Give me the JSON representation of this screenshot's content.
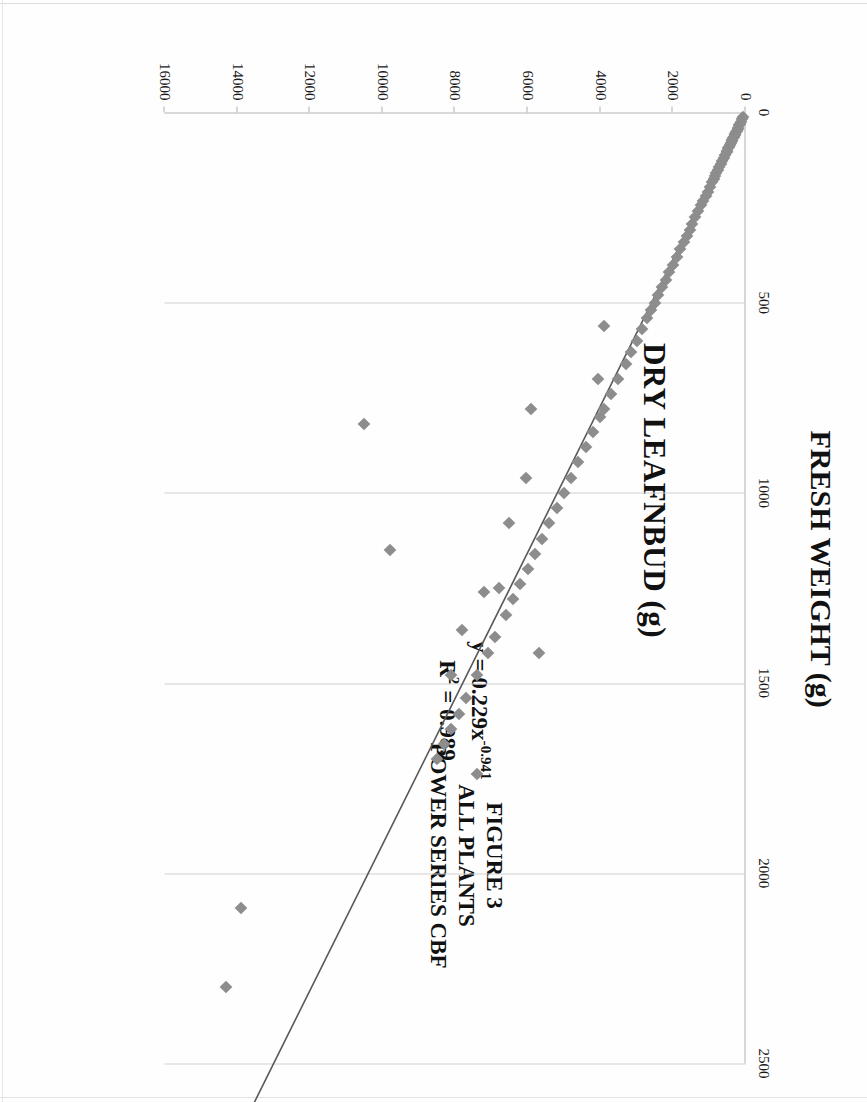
{
  "figure": {
    "caption_lines": [
      "FIGURE 3",
      "ALL PLANTS",
      "POWER SERIES CBF"
    ],
    "caption_line_1": "FIGURE 3",
    "caption_line_2": "ALL PLANTS",
    "caption_line_3": "POWER SERIES CBF"
  },
  "annotation": {
    "equation_prefix": "y = 0.229x",
    "equation_exponent": "-0.941",
    "equation_full": "y = 0.229x-0.941",
    "r_squared_label": "R",
    "r_squared_sup": "2",
    "r_squared_value": " = 0.989",
    "r_squared_full": "R2 = 0.989"
  },
  "chart_data": {
    "type": "scatter",
    "title": "",
    "xlabel": "FRESH WEIGHT (g)",
    "ylabel": "DRY LEAFNBUD (g)",
    "xlim": [
      0,
      16000
    ],
    "ylim": [
      0,
      2500
    ],
    "xticks": [
      0,
      2000,
      4000,
      6000,
      8000,
      10000,
      12000,
      14000,
      16000
    ],
    "xtick_labels": [
      "0",
      "2000",
      "4000",
      "6000",
      "8000",
      "10000",
      "12000",
      "14000",
      "16000"
    ],
    "yticks": [
      0,
      500,
      1000,
      1500,
      2000,
      2500
    ],
    "ytick_labels": [
      "0",
      "500",
      "1000",
      "1500",
      "2000",
      "2500"
    ],
    "grid": true,
    "grid_axis": "y",
    "legend": false,
    "marker": "diamond",
    "marker_color": "#8d8d8d",
    "trendline_color": "#5a5a5a",
    "trendline_type": "power",
    "trendline_equation": "y = 0.229x^-0.941",
    "trendline_r2": 0.989,
    "trendline_coefficient": 0.229,
    "trendline_exponent": 0.941,
    "series": [
      {
        "name": "ALL PLANTS",
        "x": [
          60,
          90,
          120,
          150,
          170,
          200,
          210,
          240,
          260,
          280,
          300,
          320,
          340,
          360,
          380,
          400,
          430,
          450,
          470,
          500,
          520,
          560,
          600,
          640,
          680,
          720,
          760,
          800,
          840,
          880,
          920,
          980,
          1040,
          1100,
          1160,
          1220,
          1300,
          1380,
          1460,
          1540,
          1620,
          1700,
          1800,
          1900,
          2000,
          2100,
          2200,
          2300,
          2400,
          2500,
          2600,
          2700,
          2850,
          3000,
          3150,
          3300,
          3500,
          3700,
          3900,
          4000,
          4050,
          4200,
          4400,
          4600,
          4800,
          5000,
          5200,
          5400,
          5600,
          5800,
          6000,
          6050,
          6200,
          6400,
          6600,
          6900,
          7100,
          7400,
          7700,
          7900,
          8100,
          8300,
          8500,
          5900,
          6500,
          7200,
          7800,
          9800,
          10500,
          3900,
          5700,
          6800,
          7400,
          8100,
          13900,
          14300
        ],
        "y": [
          12,
          18,
          24,
          30,
          34,
          40,
          43,
          48,
          52,
          56,
          60,
          64,
          68,
          72,
          76,
          80,
          86,
          90,
          94,
          100,
          104,
          112,
          120,
          128,
          136,
          144,
          152,
          160,
          168,
          176,
          184,
          196,
          208,
          220,
          232,
          244,
          260,
          276,
          292,
          308,
          324,
          340,
          360,
          380,
          400,
          420,
          440,
          460,
          480,
          500,
          520,
          540,
          570,
          600,
          630,
          660,
          700,
          740,
          780,
          800,
          700,
          840,
          880,
          920,
          960,
          1000,
          1040,
          1080,
          1120,
          1160,
          1200,
          960,
          1240,
          1280,
          1320,
          1380,
          1420,
          1480,
          1540,
          1580,
          1620,
          1660,
          1700,
          780,
          1080,
          1260,
          1360,
          1150,
          820,
          560,
          1420,
          1250,
          1740,
          1480,
          2090,
          2300
        ]
      }
    ],
    "trendline_points": {
      "x": [
        50,
        500,
        1500,
        3000,
        5000,
        7500,
        10000,
        12500,
        13800
      ],
      "y": [
        10,
        98,
        290,
        580,
        965,
        1445,
        1925,
        2405,
        2655
      ]
    }
  }
}
